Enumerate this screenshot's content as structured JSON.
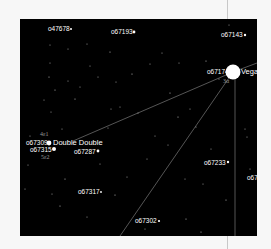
{
  "map": {
    "background": "#000000",
    "line_color": "#8a8a8a",
    "named_stars": [
      {
        "id": "vega",
        "catalog": "o67174",
        "name": "Vega",
        "flamsteed": "3α"
      },
      {
        "id": "double-double",
        "catalog_1": "o67309",
        "catalog_2": "o67315",
        "name": "Double Double",
        "flamsteed_1": "4ε1",
        "flamsteed_2": "5ε2"
      }
    ],
    "labels": [
      {
        "text": "o47678"
      },
      {
        "text": "o67193"
      },
      {
        "text": "o67143"
      },
      {
        "text": "o67287"
      },
      {
        "text": "o67233"
      },
      {
        "text": "o67317"
      },
      {
        "text": "o67302"
      },
      {
        "text": "o67"
      }
    ]
  }
}
